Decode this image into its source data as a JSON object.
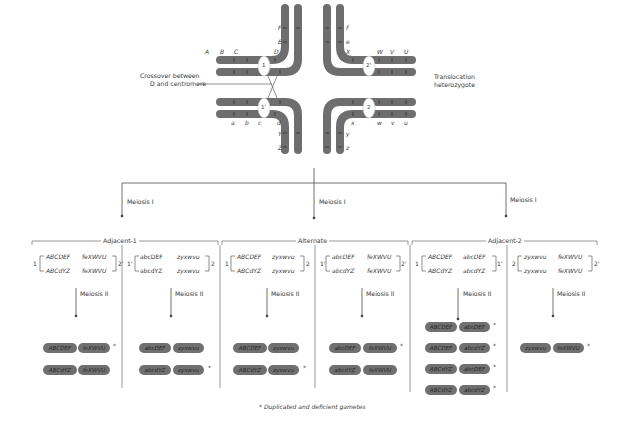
{
  "top_diagram": {
    "crossover_label": [
      "Crossover between",
      "D and centromere"
    ],
    "translocation_label": [
      "Translocation",
      "heterozygote"
    ],
    "centromeres": [
      "1",
      "2'",
      "1'",
      "2"
    ],
    "genes_top_left_horizontal": [
      "A",
      "B",
      "C",
      "D"
    ],
    "genes_top_left_vertical": [
      "F",
      "E"
    ],
    "genes_top_right_horizontal": [
      "X",
      "W",
      "V",
      "U"
    ],
    "genes_top_right_vertical": [
      "f",
      "e"
    ],
    "genes_bottom_left_horizontal": [
      "a",
      "b",
      "c",
      "d"
    ],
    "genes_bottom_left_vertical": [
      "Y",
      "Z"
    ],
    "genes_bottom_right_horizontal": [
      "x",
      "w",
      "v",
      "u"
    ],
    "genes_bottom_right_vertical": [
      "y",
      "z"
    ],
    "chromosome_color": "#6e6e6e"
  },
  "meiosis1_labels": [
    "Meiosis I",
    "Meiosis I",
    "Meiosis I"
  ],
  "groups": [
    {
      "title": "Adjacent-1",
      "panels": [
        {
          "left_num": "1",
          "right_num": "2'",
          "row1": [
            "ABCDEF",
            "feXWVU"
          ],
          "row2": [
            "ABCdYZ",
            "feXWVU"
          ],
          "meiosis2": "Meiosis II",
          "gametes": [
            {
              "a": "ABCDEF",
              "b": "feXWVU",
              "star": true
            },
            {
              "a": "ABCdYZ",
              "b": "feXWVU",
              "star": false
            }
          ]
        },
        {
          "left_num": "1'",
          "right_num": "2",
          "row1": [
            "abcDEF",
            "zyxwvu"
          ],
          "row2": [
            "abcdYZ",
            "zyxwvu"
          ],
          "meiosis2": "Meiosis II",
          "gametes": [
            {
              "a": "abcDEF",
              "b": "zyxwvu",
              "star": false
            },
            {
              "a": "abcdYZ",
              "b": "zyxwvu",
              "star": true
            }
          ]
        }
      ]
    },
    {
      "title": "Alternate",
      "panels": [
        {
          "left_num": "1",
          "right_num": "2",
          "row1": [
            "ABCDEF",
            "zyxwvu"
          ],
          "row2": [
            "ABCdYZ",
            "zyxwvu"
          ],
          "meiosis2": "Meiosis II",
          "gametes": [
            {
              "a": "ABCDEF",
              "b": "zyxwvu",
              "star": false
            },
            {
              "a": "ABCdYZ",
              "b": "zyxwvu",
              "star": true
            }
          ]
        },
        {
          "left_num": "1'",
          "right_num": "2'",
          "row1": [
            "abcDEF",
            "feXWVU"
          ],
          "row2": [
            "abcdYZ",
            "feXWVU"
          ],
          "meiosis2": "Meiosis II",
          "gametes": [
            {
              "a": "abcDEF",
              "b": "feXWVU",
              "star": true
            },
            {
              "a": "abcdYZ",
              "b": "feXWVU",
              "star": false
            }
          ]
        }
      ]
    },
    {
      "title": "Adjacent-2",
      "panels": [
        {
          "left_num": "1",
          "right_num": "1'",
          "row1": [
            "ABCDEF",
            "abcDEF"
          ],
          "row2": [
            "ABCdYZ",
            "abcdYZ"
          ],
          "meiosis2": "Meiosis II",
          "gametes": [
            {
              "a": "ABCDEF",
              "b": "abcDEF",
              "star": true
            },
            {
              "a": "ABCDEF",
              "b": "abcdYZ",
              "star": true
            },
            {
              "a": "ABCdYZ",
              "b": "abcDEF",
              "star": true
            },
            {
              "a": "ABCdYZ",
              "b": "abcdYZ",
              "star": true
            }
          ]
        },
        {
          "left_num": "2",
          "right_num": "2'",
          "row1": [
            "zyxwvu",
            "feXWVU"
          ],
          "row2": [
            "zyxwvu",
            "feXWVU"
          ],
          "meiosis2": "Meiosis II",
          "gametes": [
            {
              "a": "zyxwvu",
              "b": "feXWVU",
              "star": true
            }
          ]
        }
      ]
    }
  ],
  "footnote": "* Duplicated and deficient gametes",
  "star_symbol": "*"
}
